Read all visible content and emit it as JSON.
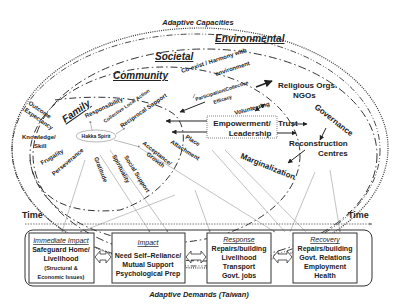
{
  "title": "Adaptive Capacities",
  "footer": "Adaptive Demands (Taiwan)",
  "levels": {
    "environmental": "Environmental",
    "societal": "Societal",
    "community": "Community",
    "family": "Family"
  },
  "concepts": {
    "outcome_expectancy_1": "Outcome",
    "outcome_expectancy_2": "Expectancy",
    "knowledge_1": "Knowledge/",
    "knowledge_2": "Skill",
    "frugality": "Frugality",
    "perseverance": "Perseverance",
    "gratitude": "Gratitude",
    "spirituality": "Spirituality",
    "social_support": "Social Support",
    "acceptance_1": "Acceptance/",
    "acceptance_2": "Growth",
    "place_1": "Place",
    "place_2": "Attachment",
    "responsibility": "Responsibility",
    "collective_local_action": "Collective Local Action",
    "reciprocal_support": "Reciprocal Support",
    "hakka_spirit": "Hakka Spirit",
    "coexist_1": "Co-exist / Harmony with",
    "coexist_2": "environment",
    "participation_1": "Participation/Collective",
    "participation_2": "Efficacy",
    "volunteering": "Volunteering",
    "religious_1": "Religious Orgs.",
    "religious_2": "NGOs",
    "empowerment_1": "Empowerment/",
    "empowerment_2": "Leadership",
    "trust": "Trust",
    "governance": "Governance",
    "reconstruction_1": "Reconstruction",
    "reconstruction_2": "Centres",
    "marginalization": "Marginalization"
  },
  "timeline": {
    "left_label": "Time",
    "right_label": "Time"
  },
  "stages": [
    {
      "title": "Immediate Impact",
      "lines": [
        "Safeguard Home/",
        "Livelihood"
      ],
      "small_lines": [
        "(Structural &",
        "Economic Issues)"
      ]
    },
    {
      "title": "Impact",
      "lines": [
        "Need Self–Reliance/",
        "Mutual Support",
        "Psychological Prep"
      ],
      "small_lines": []
    },
    {
      "title": "Response",
      "lines": [
        "Repairs/building",
        "Livelihood",
        "Transport",
        "Govt. jobs"
      ],
      "small_lines": []
    },
    {
      "title": "Recovery",
      "lines": [
        "Repairs/building",
        "Govt. Relations",
        "Employment",
        "Health"
      ],
      "small_lines": []
    }
  ],
  "colors": {
    "ink": "#222222",
    "thin_line": "#999999",
    "background": "#ffffff"
  }
}
